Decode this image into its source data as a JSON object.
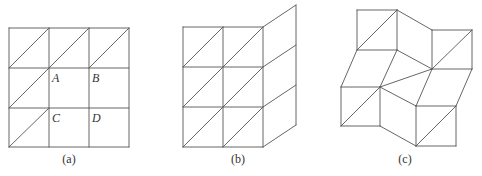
{
  "figures": [
    {
      "id": "a",
      "caption": "(a)",
      "caption_pos": [
        69,
        163
      ],
      "description": "3x3 square grid; top row and left column cells have a diagonal",
      "lines": [
        [
          9,
          28,
          129,
          28
        ],
        [
          9,
          68,
          129,
          68
        ],
        [
          9,
          108,
          129,
          108
        ],
        [
          9,
          147,
          129,
          147
        ],
        [
          9,
          28,
          9,
          147
        ],
        [
          49,
          28,
          49,
          147
        ],
        [
          89,
          28,
          89,
          147
        ],
        [
          129,
          28,
          129,
          147
        ],
        [
          9,
          68,
          49,
          28
        ],
        [
          49,
          68,
          89,
          28
        ],
        [
          89,
          68,
          129,
          28
        ],
        [
          9,
          108,
          49,
          68
        ],
        [
          9,
          147,
          49,
          108
        ]
      ],
      "labels": [
        {
          "text": "A",
          "x": 52,
          "y": 82
        },
        {
          "text": "B",
          "x": 92,
          "y": 82
        },
        {
          "text": "C",
          "x": 52,
          "y": 122
        },
        {
          "text": "D",
          "x": 92,
          "y": 122
        }
      ]
    },
    {
      "id": "b",
      "caption": "(b)",
      "caption_pos": [
        238,
        163
      ],
      "description": "2x3 triangulated squares with right column sheared upward into parallelograms",
      "lines": [
        [
          183,
          27,
          263,
          27
        ],
        [
          183,
          67,
          263,
          67
        ],
        [
          183,
          107,
          263,
          107
        ],
        [
          183,
          147,
          263,
          147
        ],
        [
          183,
          27,
          183,
          147
        ],
        [
          223,
          27,
          223,
          147
        ],
        [
          263,
          27,
          263,
          147
        ],
        [
          183,
          67,
          223,
          27
        ],
        [
          223,
          67,
          263,
          27
        ],
        [
          183,
          107,
          223,
          67
        ],
        [
          223,
          107,
          263,
          67
        ],
        [
          183,
          147,
          223,
          107
        ],
        [
          223,
          147,
          263,
          107
        ],
        [
          263,
          27,
          296,
          5
        ],
        [
          263,
          67,
          296,
          45
        ],
        [
          263,
          107,
          296,
          85
        ],
        [
          263,
          147,
          296,
          125
        ],
        [
          296,
          5,
          296,
          125
        ]
      ],
      "labels": []
    },
    {
      "id": "c",
      "caption": "(c)",
      "caption_pos": [
        405,
        163
      ],
      "description": "Pinwheel-like arrangement of four triangulated squares connected by rhombi",
      "lines": [
        [
          357,
          10,
          397,
          10
        ],
        [
          357,
          10,
          357,
          50
        ],
        [
          357,
          50,
          397,
          50
        ],
        [
          397,
          10,
          397,
          50
        ],
        [
          357,
          50,
          397,
          10
        ],
        [
          397,
          10,
          432,
          30
        ],
        [
          397,
          50,
          432,
          69
        ],
        [
          432,
          30,
          472,
          30
        ],
        [
          432,
          30,
          432,
          69
        ],
        [
          472,
          30,
          472,
          69
        ],
        [
          432,
          69,
          472,
          69
        ],
        [
          432,
          69,
          472,
          30
        ],
        [
          357,
          50,
          341,
          87
        ],
        [
          397,
          50,
          380,
          87
        ],
        [
          341,
          87,
          380,
          87
        ],
        [
          341,
          87,
          341,
          126
        ],
        [
          341,
          126,
          380,
          126
        ],
        [
          380,
          87,
          380,
          126
        ],
        [
          341,
          126,
          380,
          87
        ],
        [
          380,
          87,
          432,
          69
        ],
        [
          380,
          87,
          416,
          106
        ],
        [
          380,
          126,
          416,
          146
        ],
        [
          432,
          69,
          416,
          106
        ],
        [
          472,
          69,
          456,
          106
        ],
        [
          416,
          106,
          456,
          106
        ],
        [
          416,
          106,
          416,
          146
        ],
        [
          416,
          146,
          456,
          146
        ],
        [
          456,
          106,
          456,
          146
        ],
        [
          416,
          146,
          456,
          106
        ]
      ],
      "labels": []
    }
  ]
}
